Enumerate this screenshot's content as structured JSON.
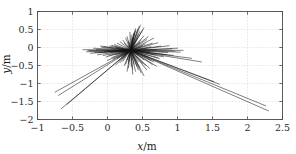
{
  "chart_data": {
    "type": "line",
    "title": "",
    "subtitle": "",
    "xlabel": "x/m",
    "ylabel": "y/m",
    "xlim": [
      -1,
      2.5
    ],
    "ylim": [
      -2,
      1
    ],
    "xticks": [
      -1,
      -0.5,
      0,
      0.5,
      1,
      1.5,
      2,
      2.5
    ],
    "xticklabels": [
      "−1",
      "−0.5",
      "0",
      "0.5",
      "1",
      "1.5",
      "2",
      "2.5"
    ],
    "yticks": [
      1,
      0.5,
      0,
      -0.5,
      -1,
      -1.5,
      -2
    ],
    "yticklabels": [
      "1",
      "0.5",
      "0",
      "−0.5",
      "−1",
      "−1.5",
      "−2"
    ],
    "grid": true,
    "grid_style": "dotted",
    "legend": "none",
    "origin": [
      0.33,
      -0.08
    ],
    "series": [
      {
        "name": "rays",
        "type": "segments",
        "color": "#151515",
        "segments": [
          [
            0.33,
            -0.08,
            -0.75,
            -1.24
          ],
          [
            0.33,
            -0.08,
            -0.66,
            -1.7
          ],
          [
            0.33,
            -0.08,
            -0.7,
            -1.33
          ],
          [
            0.33,
            -0.08,
            -0.58,
            -1.58
          ],
          [
            0.33,
            -0.08,
            2.3,
            -1.76
          ],
          [
            0.33,
            -0.08,
            2.26,
            -1.62
          ],
          [
            0.33,
            -0.08,
            1.6,
            -1.02
          ],
          [
            0.33,
            -0.08,
            1.52,
            -0.95
          ],
          [
            0.33,
            -0.08,
            0.47,
            0.62
          ],
          [
            0.33,
            -0.08,
            0.52,
            0.55
          ],
          [
            0.33,
            -0.08,
            0.4,
            0.47
          ],
          [
            0.33,
            -0.08,
            0.58,
            0.3
          ],
          [
            0.33,
            -0.08,
            0.66,
            0.26
          ],
          [
            0.33,
            -0.08,
            0.72,
            0.13
          ],
          [
            0.33,
            -0.08,
            0.88,
            0.05
          ],
          [
            0.33,
            -0.08,
            1.0,
            -0.02
          ],
          [
            0.33,
            -0.08,
            1.04,
            -0.13
          ],
          [
            0.33,
            -0.08,
            0.94,
            -0.22
          ],
          [
            0.33,
            -0.08,
            0.74,
            -0.31
          ],
          [
            0.33,
            -0.08,
            0.64,
            -0.47
          ],
          [
            0.33,
            -0.08,
            0.56,
            -0.62
          ],
          [
            0.33,
            -0.08,
            0.48,
            -0.7
          ],
          [
            0.33,
            -0.08,
            0.42,
            -0.52
          ],
          [
            0.33,
            -0.08,
            0.36,
            -0.6
          ],
          [
            0.33,
            -0.08,
            0.3,
            -0.44
          ],
          [
            0.33,
            -0.08,
            0.22,
            -0.38
          ],
          [
            0.33,
            -0.08,
            0.14,
            -0.3
          ],
          [
            0.33,
            -0.08,
            0.02,
            -0.22
          ],
          [
            0.33,
            -0.08,
            -0.12,
            -0.14
          ],
          [
            0.33,
            -0.08,
            -0.26,
            -0.1
          ],
          [
            0.33,
            -0.08,
            -0.35,
            -0.06
          ],
          [
            0.33,
            -0.08,
            -0.2,
            -0.02
          ],
          [
            0.33,
            -0.08,
            -0.05,
            0.02
          ],
          [
            0.33,
            -0.08,
            0.1,
            0.08
          ],
          [
            0.33,
            -0.08,
            0.18,
            0.16
          ],
          [
            0.33,
            -0.08,
            0.26,
            0.26
          ],
          [
            0.33,
            -0.08,
            0.34,
            0.34
          ],
          [
            0.33,
            -0.08,
            0.42,
            0.22
          ],
          [
            0.33,
            -0.08,
            0.46,
            0.14
          ],
          [
            0.33,
            -0.08,
            0.5,
            0.04
          ],
          [
            0.33,
            -0.08,
            0.55,
            -0.04
          ],
          [
            0.33,
            -0.08,
            0.6,
            -0.12
          ],
          [
            0.33,
            -0.08,
            0.68,
            -0.2
          ],
          [
            0.33,
            -0.08,
            0.8,
            -0.26
          ],
          [
            0.33,
            -0.08,
            0.52,
            -0.34
          ],
          [
            0.33,
            -0.08,
            0.44,
            -0.4
          ],
          [
            0.33,
            -0.08,
            0.38,
            -0.46
          ],
          [
            0.33,
            -0.08,
            0.28,
            -0.34
          ],
          [
            0.33,
            -0.08,
            0.2,
            -0.26
          ],
          [
            0.33,
            -0.08,
            0.12,
            -0.2
          ],
          [
            0.33,
            -0.08,
            0.04,
            -0.14
          ],
          [
            0.33,
            -0.08,
            -0.04,
            -0.12
          ],
          [
            0.33,
            -0.08,
            0.24,
            0.12
          ],
          [
            0.33,
            -0.08,
            0.3,
            0.18
          ],
          [
            0.33,
            -0.08,
            0.38,
            0.4
          ],
          [
            0.33,
            -0.08,
            0.44,
            0.36
          ],
          [
            0.33,
            -0.08,
            0.36,
            0.28
          ],
          [
            0.33,
            -0.08,
            0.48,
            0.2
          ],
          [
            0.33,
            -0.08,
            0.54,
            0.1
          ],
          [
            0.33,
            -0.08,
            0.62,
            0.02
          ],
          [
            0.33,
            -0.08,
            0.7,
            -0.06
          ],
          [
            0.33,
            -0.08,
            0.86,
            -0.14
          ],
          [
            0.33,
            -0.08,
            0.96,
            -0.1
          ],
          [
            0.33,
            -0.08,
            0.58,
            -0.26
          ],
          [
            0.33,
            -0.08,
            0.5,
            -0.44
          ],
          [
            0.33,
            -0.08,
            0.46,
            -0.56
          ],
          [
            0.33,
            -0.08,
            0.4,
            -0.66
          ],
          [
            0.33,
            -0.08,
            0.34,
            -0.52
          ],
          [
            0.33,
            -0.08,
            0.26,
            -0.46
          ],
          [
            0.33,
            -0.08,
            0.18,
            -0.42
          ],
          [
            0.33,
            -0.08,
            0.08,
            -0.32
          ],
          [
            0.33,
            -0.08,
            -0.02,
            -0.26
          ],
          [
            0.33,
            -0.08,
            -0.14,
            -0.2
          ],
          [
            0.33,
            -0.08,
            -0.24,
            -0.16
          ],
          [
            0.33,
            -0.08,
            -0.3,
            -0.12
          ],
          [
            0.33,
            -0.08,
            -0.16,
            -0.06
          ],
          [
            0.33,
            -0.08,
            -0.08,
            0.0
          ],
          [
            0.33,
            -0.08,
            0.06,
            0.06
          ],
          [
            0.33,
            -0.08,
            0.14,
            0.12
          ],
          [
            0.33,
            -0.08,
            0.22,
            0.2
          ],
          [
            0.33,
            -0.08,
            0.28,
            0.3
          ],
          [
            0.33,
            -0.08,
            0.32,
            0.42
          ],
          [
            0.33,
            -0.08,
            0.4,
            0.52
          ],
          [
            0.33,
            -0.08,
            0.46,
            0.44
          ],
          [
            0.33,
            -0.08,
            0.52,
            0.32
          ],
          [
            0.33,
            -0.08,
            0.56,
            0.22
          ],
          [
            0.33,
            -0.08,
            0.64,
            0.12
          ],
          [
            0.33,
            -0.08,
            0.76,
            0.04
          ],
          [
            0.33,
            -0.08,
            0.92,
            -0.04
          ],
          [
            0.33,
            -0.08,
            1.08,
            -0.08
          ],
          [
            0.33,
            -0.08,
            0.84,
            -0.2
          ],
          [
            0.33,
            -0.08,
            0.72,
            -0.28
          ],
          [
            0.33,
            -0.08,
            0.62,
            -0.36
          ],
          [
            0.33,
            -0.08,
            0.54,
            -0.5
          ],
          [
            0.33,
            -0.08,
            0.44,
            -0.62
          ],
          [
            0.33,
            -0.08,
            0.3,
            -0.56
          ],
          [
            0.33,
            -0.08,
            0.24,
            -0.5
          ],
          [
            0.33,
            -0.08,
            0.16,
            -0.36
          ],
          [
            0.33,
            -0.08,
            0.06,
            -0.28
          ],
          [
            0.33,
            -0.08,
            -0.06,
            -0.22
          ],
          [
            0.33,
            -0.08,
            -0.18,
            -0.14
          ],
          [
            0.33,
            -0.08,
            -0.28,
            -0.08
          ],
          [
            0.33,
            -0.08,
            0.45,
            0.58
          ],
          [
            0.33,
            -0.08,
            0.43,
            0.5
          ],
          [
            0.33,
            -0.08,
            0.5,
            0.48
          ],
          [
            0.33,
            -0.08,
            0.39,
            0.44
          ],
          [
            0.33,
            -0.08,
            0.37,
            0.38
          ],
          [
            0.33,
            -0.08,
            0.35,
            0.24
          ],
          [
            0.33,
            -0.08,
            0.31,
            0.14
          ],
          [
            0.33,
            -0.08,
            0.29,
            0.06
          ],
          [
            0.33,
            -0.08,
            0.27,
            -0.02
          ],
          [
            0.33,
            -0.08,
            0.25,
            -0.14
          ],
          [
            0.33,
            -0.08,
            0.23,
            -0.24
          ],
          [
            0.33,
            -0.08,
            0.21,
            -0.32
          ],
          [
            0.33,
            -0.08,
            0.19,
            -0.2
          ],
          [
            0.33,
            -0.08,
            0.17,
            -0.12
          ],
          [
            0.33,
            -0.08,
            0.15,
            -0.04
          ],
          [
            0.33,
            -0.08,
            0.11,
            0.02
          ],
          [
            0.33,
            -0.08,
            0.03,
            0.04
          ],
          [
            0.33,
            -0.08,
            -0.1,
            0.04
          ],
          [
            0.33,
            -0.08,
            0.66,
            -0.4
          ],
          [
            0.33,
            -0.08,
            0.7,
            -0.52
          ],
          [
            0.33,
            -0.08,
            0.6,
            -0.58
          ],
          [
            0.33,
            -0.08,
            0.52,
            -0.78
          ],
          [
            0.33,
            -0.08,
            0.36,
            -0.74
          ],
          [
            0.33,
            -0.08,
            0.28,
            -0.66
          ],
          [
            0.33,
            -0.08,
            0.12,
            -0.48
          ],
          [
            0.33,
            -0.08,
            0.0,
            -0.36
          ],
          [
            0.33,
            -0.08,
            1.2,
            -0.3
          ],
          [
            0.33,
            -0.08,
            1.34,
            -0.4
          ],
          [
            0.33,
            -0.08,
            0.4,
            0.1
          ],
          [
            0.33,
            -0.08,
            0.38,
            0.02
          ],
          [
            0.33,
            -0.08,
            0.36,
            -0.06
          ],
          [
            0.33,
            -0.08,
            0.34,
            -0.16
          ],
          [
            0.33,
            -0.08,
            0.32,
            -0.26
          ],
          [
            0.33,
            -0.08,
            0.3,
            -0.36
          ]
        ]
      }
    ]
  },
  "axes": {
    "x_title_var": "x",
    "x_title_unit": "/m",
    "y_title_var": "y",
    "y_title_unit": "/m"
  },
  "colors": {
    "background": "#ffffff",
    "frame": "#4a4a4a",
    "grid": "#c9c9c9",
    "data": "#151515",
    "tick_label": "#2b2b2b"
  }
}
